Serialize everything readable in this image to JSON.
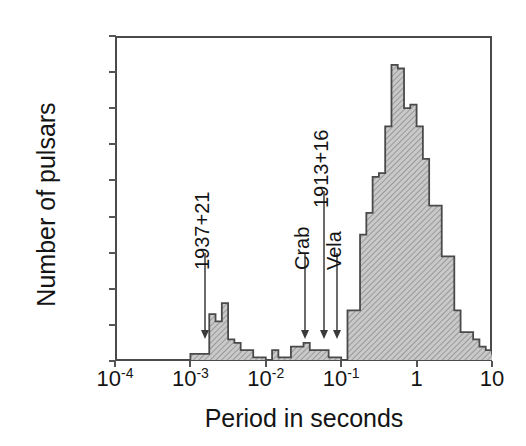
{
  "chart_data": {
    "type": "bar",
    "title": "",
    "xlabel": "Period in seconds",
    "ylabel": "Number of pulsars",
    "xscale": "log",
    "xlim": [
      0.0001,
      10
    ],
    "ylim": [
      0,
      90
    ],
    "grid": false,
    "legend": null,
    "xticks": [
      {
        "value": 0.0001,
        "label": "10",
        "exponent": "-4"
      },
      {
        "value": 0.001,
        "label": "10",
        "exponent": "-3"
      },
      {
        "value": 0.01,
        "label": "10",
        "exponent": "-2"
      },
      {
        "value": 0.1,
        "label": "10",
        "exponent": "-1"
      },
      {
        "value": 1,
        "label": "1",
        "exponent": ""
      },
      {
        "value": 10,
        "label": "10",
        "exponent": ""
      }
    ],
    "yticks": [
      0,
      10,
      20,
      30,
      40,
      50,
      60,
      70,
      80,
      90
    ],
    "bin_width_dex": 0.08333333,
    "x_start_dex": -4.0,
    "bar_color": "#b3b3b3",
    "bar_edge_color": "#4a4a4a",
    "values": [
      0,
      0,
      0,
      0,
      0,
      0,
      0,
      0,
      0,
      0,
      0,
      0,
      2,
      2,
      2,
      13,
      11,
      16,
      6,
      5,
      3,
      3,
      1,
      1,
      0,
      3,
      1,
      1,
      4,
      4,
      5,
      3,
      3,
      3,
      1,
      1,
      0,
      14,
      14,
      35,
      41,
      51,
      52,
      65,
      82,
      81,
      70,
      71,
      65,
      56,
      43,
      43,
      29,
      29,
      14,
      8,
      8,
      6,
      4,
      3,
      2,
      2,
      1,
      1,
      0,
      0,
      0,
      0,
      0,
      0,
      0,
      0
    ],
    "annotations": [
      {
        "label": "1937+21",
        "x": 0.00155,
        "arrow_top_y": 30,
        "arrow_bottom_y": 6
      },
      {
        "label": "Crab",
        "x": 0.0335,
        "arrow_top_y": 30,
        "arrow_bottom_y": 6
      },
      {
        "label": "1913+16",
        "x": 0.0595,
        "arrow_top_y": 47,
        "arrow_bottom_y": 6
      },
      {
        "label": "Vela",
        "x": 0.089,
        "arrow_top_y": 30,
        "arrow_bottom_y": 6
      }
    ]
  }
}
